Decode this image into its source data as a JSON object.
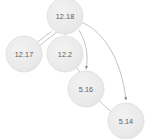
{
  "graph": {
    "type": "directed-graph",
    "layout": "top-down",
    "background_color": "#ffffff",
    "node_fill_color": "#ebebeb",
    "node_stroke_color": "#d8d8d8",
    "node_text_color": "#5a5a5a",
    "edge_color": "#b4b4b4",
    "arrowhead_color": "#888888",
    "node_radius": 18,
    "nodes": [
      {
        "id": "n0",
        "label": "12.18",
        "cx": 65,
        "cy": 16,
        "r": 18
      },
      {
        "id": "n1",
        "label": "12.17",
        "cx": 24,
        "cy": 54,
        "r": 18
      },
      {
        "id": "n2",
        "label": "12.2",
        "cx": 65,
        "cy": 54,
        "r": 18
      },
      {
        "id": "n3",
        "label": "5.16",
        "cx": 86,
        "cy": 89,
        "r": 18
      },
      {
        "id": "n4",
        "label": "5.14",
        "cx": 126,
        "cy": 121,
        "r": 18
      }
    ],
    "edges": [
      {
        "from": "12.18",
        "to": "12.17",
        "parallel_index": 1,
        "path": "M 57 32 C 48 38 42 42 36 47"
      },
      {
        "from": "12.18",
        "to": "12.17",
        "parallel_index": 2,
        "path": "M 52 31 C 45 36 40 41 34 45"
      },
      {
        "from": "12.18",
        "to": "12.2",
        "parallel_index": 1,
        "path": "M 65 34 L 65 35"
      },
      {
        "from": "12.18",
        "to": "5.16",
        "parallel_index": 1,
        "path": "M 80 30 C 88 45 88 58 86 70"
      },
      {
        "from": "12.18",
        "to": "5.14",
        "parallel_index": 1,
        "path": "M 82 23 C 104 32 122 60 126 101"
      },
      {
        "from": "12.2",
        "to": "5.16",
        "parallel_index": 1,
        "path": "M 76 67 C 79 71 81 74 84 78"
      },
      {
        "from": "5.16",
        "to": "5.14",
        "parallel_index": 1,
        "path": "M 99 100 C 105 106 110 111 116 116"
      }
    ],
    "edge_count": 7,
    "node_count": 5
  }
}
